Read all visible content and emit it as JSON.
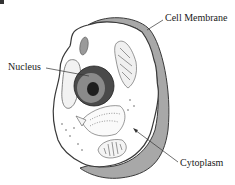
{
  "diagram": {
    "type": "animal-cell",
    "labels": {
      "cell_membrane": "Cell Membrane",
      "nucleus": "Nucleus",
      "cytoplasm": "Cytoplasm"
    },
    "colors": {
      "membrane_fill": "#a8a8a8",
      "outline": "#3a3a3a",
      "nucleus_outer": "#4a4a4a",
      "nucleus_inner": "#8a8a8a",
      "nucleolus": "#1e1e1e",
      "cytoplasm": "#ffffff"
    }
  }
}
